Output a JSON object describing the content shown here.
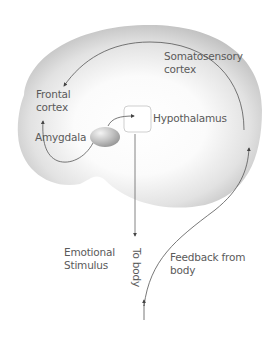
{
  "diagram": {
    "type": "flow-diagram",
    "title": "",
    "nodes": [
      {
        "id": "somatosensory",
        "line1": "Somatosensory",
        "line2": "cortex"
      },
      {
        "id": "frontal",
        "line1": "Frontal",
        "line2": "cortex"
      },
      {
        "id": "amygdala",
        "label": "Amygdala"
      },
      {
        "id": "hypothalamus",
        "label": "Hypothalamus"
      },
      {
        "id": "stimulus",
        "line1": "Emotional",
        "line2": "Stimulus"
      },
      {
        "id": "to_body",
        "label": "To body"
      },
      {
        "id": "feedback",
        "line1": "Feedback from",
        "line2": "body"
      }
    ],
    "edges": [
      {
        "from": "amygdala",
        "to": "hypothalamus"
      },
      {
        "from": "amygdala",
        "to": "frontal"
      },
      {
        "from": "hypothalamus",
        "to": "body",
        "label": "To body"
      },
      {
        "from": "body",
        "to": "somatosensory",
        "label": "Feedback from body"
      },
      {
        "from": "somatosensory",
        "to": "frontal"
      }
    ],
    "colors": {
      "shape_outer": "#bdbdbd",
      "shape_inner": "#ffffff",
      "line": "#555555",
      "text": "#5a5a5a",
      "box_border": "#c8c8c8",
      "sphere": "#a8a8a8"
    }
  }
}
